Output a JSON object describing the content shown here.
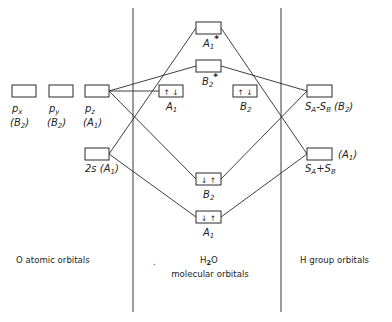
{
  "colors": {
    "line": "#2a2a2a",
    "background": "#ffffff",
    "text": "#1e1e1e"
  },
  "column_labels": {
    "o_atomic": "O atomic orbitals",
    "h2o": {
      "main": "H",
      "sub": "2",
      "rest": "O"
    },
    "h2o_line2": "molecular orbitals",
    "h_group": "H group orbitals",
    "marker_dot": "."
  },
  "o_atomic_orbitals": {
    "px": {
      "label": "p",
      "label_sub": "x",
      "sym_prefix": "(B",
      "sym_sub": "2",
      "sym_suffix": ")"
    },
    "py": {
      "label": "p",
      "label_sub": "y",
      "sym_prefix": "(B",
      "sym_sub": "2",
      "sym_suffix": ")"
    },
    "pz": {
      "label": "p",
      "label_sub": "z",
      "sym_prefix": "(A",
      "sym_sub": "1",
      "sym_suffix": ")"
    },
    "s2": {
      "label": "2s",
      "sym_prefix": " (A",
      "sym_sub": "1",
      "sym_suffix": ")"
    }
  },
  "h2o_molecular_orbitals": {
    "a1_antibonding": {
      "label": "A",
      "sub": "1",
      "sup": "*",
      "electrons": ""
    },
    "b2_antibonding": {
      "label": "B",
      "sub": "2",
      "sup": "*",
      "electrons": ""
    },
    "a1_nonbonding": {
      "label": "A",
      "sub": "1",
      "electrons": "↑ ↓"
    },
    "b2_nonbonding": {
      "label": "B",
      "sub": "2",
      "electrons": "↑ ↓"
    },
    "b2_bonding": {
      "label": "B",
      "sub": "2",
      "electrons": "↓ ↑"
    },
    "a1_bonding": {
      "label": "A",
      "sub": "1",
      "electrons": "↓ ↑"
    }
  },
  "h_group_orbitals": {
    "minus": {
      "s1": "S",
      "s1_sub": "A",
      "op": "-",
      "s2": "S",
      "s2_sub": "B",
      "sym_prefix": " (B",
      "sym_sub": "2",
      "sym_suffix": ")"
    },
    "plus": {
      "s1": "S",
      "s1_sub": "A",
      "op": "+",
      "s2": "S",
      "s2_sub": "B",
      "sym_prefix": "(A",
      "sym_sub": "1",
      "sym_suffix": ")"
    }
  }
}
